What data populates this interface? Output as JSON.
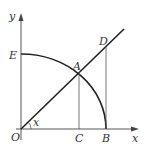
{
  "diagram": {
    "axes": {
      "x_label": "x",
      "y_label": "y"
    },
    "points": {
      "O": "O",
      "A": "A",
      "B": "B",
      "C": "C",
      "D": "D",
      "E": "E"
    },
    "angle_label": "x",
    "colors": {
      "stroke": "#222222",
      "label": "#333333",
      "background": "#ffffff"
    }
  }
}
